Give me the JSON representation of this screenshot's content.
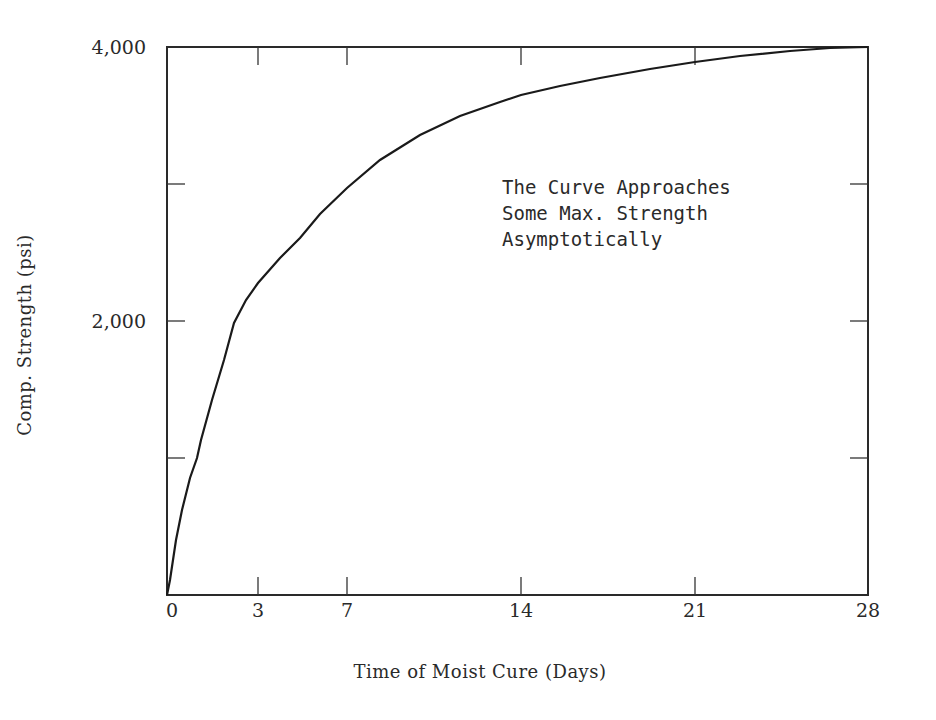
{
  "chart_data": {
    "type": "line",
    "title": "",
    "xlabel": "Time of Moist Cure (Days)",
    "ylabel": "Comp. Strength (psi)",
    "xlim": [
      0,
      28
    ],
    "ylim": [
      0,
      4000
    ],
    "x_ticks": [
      0,
      3,
      7,
      14,
      21,
      28
    ],
    "x_tick_labels": [
      "0",
      "3",
      "7",
      "14",
      "21",
      "28"
    ],
    "y_ticks": [
      0,
      1000,
      2000,
      3000,
      4000
    ],
    "y_tick_labels": [
      "",
      "",
      "2,000",
      "",
      "4,000"
    ],
    "grid": false,
    "legend": null,
    "annotation": {
      "lines": [
        "The Curve Approaches",
        "Some Max. Strength",
        "Asymptotically"
      ]
    },
    "series": [
      {
        "name": "Compressive strength vs. moist cure time",
        "x": [
          0,
          0.1,
          0.3,
          0.5,
          0.9,
          1.0,
          1.5,
          2.0,
          2.2,
          3,
          5,
          7,
          10,
          14,
          21,
          28
        ],
        "y": [
          0,
          110,
          400,
          620,
          860,
          1000,
          1350,
          1650,
          2000,
          2150,
          2650,
          2970,
          3350,
          3650,
          3900,
          4000
        ]
      }
    ]
  },
  "plot_px": {
    "left": 167,
    "right": 868,
    "top": 47,
    "bottom": 595,
    "x_tick_px": [
      167,
      258,
      347,
      521,
      695,
      868
    ],
    "curve_px": [
      [
        167,
        595
      ],
      [
        170,
        580
      ],
      [
        176,
        540
      ],
      [
        182,
        510
      ],
      [
        190,
        478
      ],
      [
        197,
        458
      ],
      [
        201,
        440
      ],
      [
        212,
        400
      ],
      [
        224,
        360
      ],
      [
        234,
        323
      ],
      [
        246,
        300
      ],
      [
        258,
        283
      ],
      [
        280,
        258
      ],
      [
        300,
        238
      ],
      [
        320,
        214
      ],
      [
        347,
        188
      ],
      [
        380,
        160
      ],
      [
        420,
        135
      ],
      [
        460,
        116
      ],
      [
        500,
        102
      ],
      [
        521,
        95
      ],
      [
        560,
        86
      ],
      [
        600,
        78
      ],
      [
        650,
        69
      ],
      [
        695,
        62
      ],
      [
        740,
        56
      ],
      [
        790,
        51
      ],
      [
        830,
        48
      ],
      [
        868,
        47
      ]
    ]
  }
}
